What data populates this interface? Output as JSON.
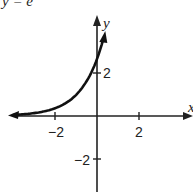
{
  "title_partial": "y = e",
  "chart_data": {
    "type": "line",
    "xlabel": "x",
    "ylabel": "y",
    "xticks": [
      "-2",
      "2"
    ],
    "yticks": [
      "2",
      "-2"
    ],
    "xlim": [
      -4.3,
      4.5
    ],
    "ylim": [
      -4,
      4.5
    ],
    "grid": false,
    "series": [
      {
        "name": "exponential curve",
        "x": [
          -4.0,
          -3.0,
          -2.0,
          -1.5,
          -1.0,
          -0.5,
          0.0,
          0.3
        ],
        "y": [
          0.05,
          0.14,
          0.37,
          0.61,
          1.0,
          1.65,
          2.72,
          3.67
        ]
      }
    ],
    "annotations": [
      "arrowheads at both ends of curve",
      "axes with arrowheads"
    ]
  },
  "labels": {
    "x_axis": "x",
    "y_axis": "y",
    "tick_neg2_x": "−2",
    "tick_2_x": "2",
    "tick_2_y": "2",
    "tick_neg2_y": "−2"
  }
}
